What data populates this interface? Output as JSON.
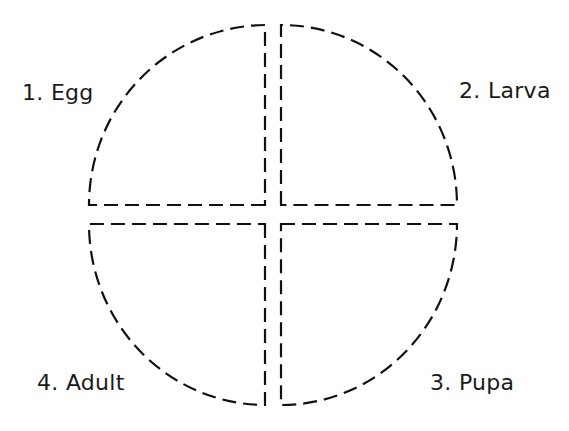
{
  "diagram": {
    "type": "life-cycle",
    "stages": [
      {
        "id": "egg",
        "label": "1. Egg",
        "quadrant": "top-left"
      },
      {
        "id": "larva",
        "label": "2. Larva",
        "quadrant": "top-right"
      },
      {
        "id": "pupa",
        "label": "3. Pupa",
        "quadrant": "bottom-right"
      },
      {
        "id": "adult",
        "label": "4. Adult",
        "quadrant": "bottom-left"
      }
    ],
    "style": {
      "stroke": "#111111",
      "background": "#ffffff",
      "dash": "dashed"
    }
  }
}
